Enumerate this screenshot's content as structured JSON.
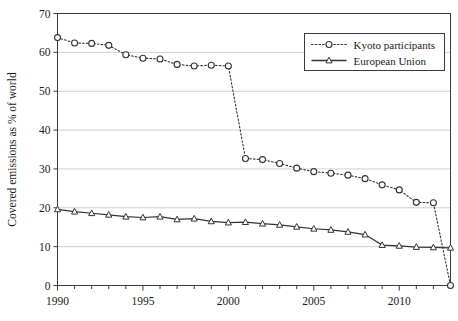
{
  "chart_data": {
    "type": "line",
    "title": "",
    "xlabel": "",
    "ylabel": "Covered emissions as % of world",
    "xlim": [
      1990,
      2013
    ],
    "ylim": [
      0,
      70
    ],
    "ytick_labels": [
      "0",
      "10",
      "20",
      "30",
      "40",
      "50",
      "60",
      "70"
    ],
    "yticks": [
      0,
      10,
      20,
      30,
      40,
      50,
      60,
      70
    ],
    "xtick_labels": [
      "1990",
      "1995",
      "2000",
      "2005",
      "2010"
    ],
    "xticks": [
      1990,
      1995,
      2000,
      2005,
      2010
    ],
    "xticks_minor": [
      1991,
      1992,
      1993,
      1994,
      1996,
      1997,
      1998,
      1999,
      2001,
      2002,
      2003,
      2004,
      2006,
      2007,
      2008,
      2009,
      2011,
      2012,
      2013
    ],
    "grid": true,
    "grid_axis": "y",
    "grid_color": "#b8b8b8",
    "legend_position": "top-right",
    "x": [
      1990,
      1991,
      1992,
      1993,
      1994,
      1995,
      1996,
      1997,
      1998,
      1999,
      2000,
      2001,
      2002,
      2003,
      2004,
      2005,
      2006,
      2007,
      2008,
      2009,
      2010,
      2011,
      2012,
      2013
    ],
    "series": [
      {
        "name": "Kyoto participants",
        "marker": "circle-open",
        "linestyle": "dotted",
        "color": "#333333",
        "values": [
          63.8,
          62.4,
          62.3,
          61.8,
          59.4,
          58.5,
          58.3,
          56.9,
          56.5,
          56.7,
          56.5,
          32.7,
          32.4,
          31.4,
          30.2,
          29.3,
          28.9,
          28.4,
          27.5,
          25.9,
          24.6,
          21.4,
          21.3,
          0.0
        ]
      },
      {
        "name": "European Union",
        "marker": "triangle-open",
        "linestyle": "solid",
        "color": "#333333",
        "values": [
          19.6,
          19.0,
          18.6,
          18.2,
          17.7,
          17.5,
          17.7,
          17.0,
          17.2,
          16.5,
          16.2,
          16.3,
          15.9,
          15.6,
          15.1,
          14.6,
          14.3,
          13.8,
          13.1,
          10.4,
          10.2,
          9.9,
          9.8,
          9.7
        ]
      }
    ]
  },
  "legend": {
    "entries": [
      {
        "label": "Kyoto participants"
      },
      {
        "label": "European Union"
      }
    ]
  }
}
